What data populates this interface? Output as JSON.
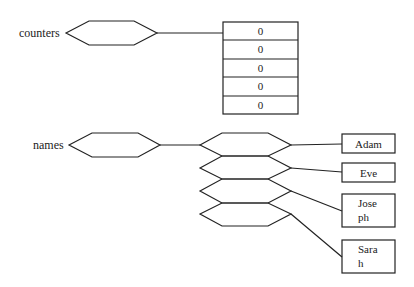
{
  "diagram": {
    "counters": {
      "label": "counters",
      "values": [
        "0",
        "0",
        "0",
        "0",
        "0"
      ]
    },
    "names": {
      "label": "names",
      "values": [
        "Adam",
        "Eve",
        "Jose\nph",
        "Sara\nh"
      ]
    },
    "colors": {
      "stroke": "#222222",
      "background": "#ffffff"
    }
  }
}
